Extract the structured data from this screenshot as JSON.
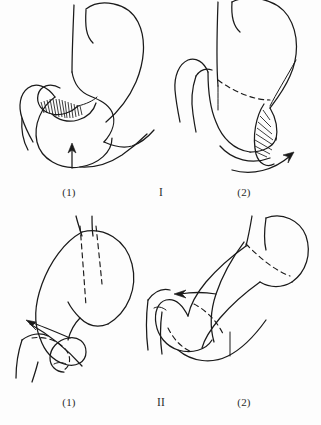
{
  "figure": {
    "background_color": "#fdfdfd",
    "ink_color": "#1a1a1a",
    "width": 321,
    "height": 425
  },
  "rows": [
    {
      "group_label": "I",
      "group_label_name": "group-label-one",
      "panels": [
        {
          "label": "(1)",
          "name": "panel-one-step-one",
          "position": "top-left"
        },
        {
          "label": "(2)",
          "name": "panel-one-step-two",
          "position": "top-right"
        }
      ]
    },
    {
      "group_label": "II",
      "group_label_name": "group-label-two",
      "panels": [
        {
          "label": "(1)",
          "name": "panel-two-step-one",
          "position": "bottom-left"
        },
        {
          "label": "(2)",
          "name": "panel-two-step-two",
          "position": "bottom-right"
        }
      ]
    }
  ],
  "captions": {
    "row1_left": "(1)",
    "row1_center": "I",
    "row1_right": "(2)",
    "row2_left": "(1)",
    "row2_center": "II",
    "row2_right": "(2)"
  },
  "annotations": {
    "hatched_region_panel1": "shaded anastomosis area",
    "hatched_region_panel2": "shaded resection margin",
    "arrow_panel1": "upward direction arrow",
    "arrow_panel2": "curved direction arrow",
    "arrow_panel3": "leftward direction arrow",
    "arrow_panel4": "leftward direction arrow",
    "dashed_outline": "hidden contour lines"
  }
}
